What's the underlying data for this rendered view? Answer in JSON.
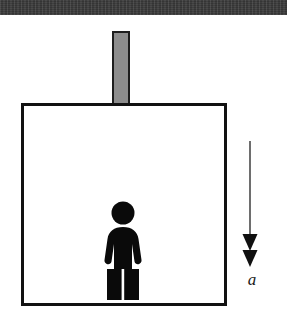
{
  "figure": {
    "background_color": "#ffffff",
    "width": 287,
    "height": 320
  },
  "ceiling": {
    "name": "ceiling-band",
    "color": "#3b3b3b",
    "label": ""
  },
  "rod": {
    "name": "support-rod",
    "fill_color": "#8d8d8d",
    "stroke_color": "#1e1e1e",
    "label": ""
  },
  "elevator": {
    "name": "elevator-cabin",
    "fill_color": "#ffffff",
    "stroke_color": "#121212",
    "label": ""
  },
  "person": {
    "name": "person-pictogram",
    "fill_color": "#0a0a0a",
    "label": ""
  },
  "arrow": {
    "name": "acceleration-arrow",
    "direction": "down",
    "arrowheads": 2,
    "color": "#1a1a1a",
    "label": "a"
  }
}
